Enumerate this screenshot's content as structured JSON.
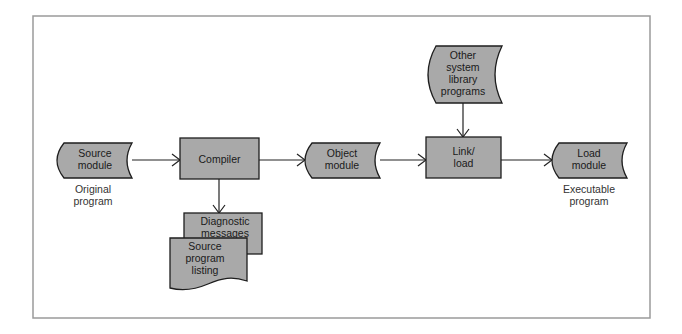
{
  "diagram": {
    "type": "flowchart",
    "title": "",
    "colors": {
      "node_fill": "#a9a9a9",
      "node_stroke": "#1e1e1e",
      "frame_stroke": "#9a9a9a",
      "edge": "#222222"
    },
    "nodes": {
      "source_module": {
        "shape": "stored-data",
        "lines": [
          "Source",
          "module"
        ],
        "caption": [
          "Original",
          "program"
        ]
      },
      "compiler": {
        "shape": "process",
        "lines": [
          "Compiler"
        ]
      },
      "diagnostic_messages": {
        "shape": "process",
        "lines": [
          "Diagnostic",
          "messages"
        ]
      },
      "source_program_listing": {
        "shape": "document",
        "lines": [
          "Source",
          "program",
          "listing"
        ]
      },
      "object_module": {
        "shape": "stored-data",
        "lines": [
          "Object",
          "module"
        ]
      },
      "other_system_library_programs": {
        "shape": "stored-data",
        "lines": [
          "Other",
          "system",
          "library",
          "programs"
        ]
      },
      "link_load": {
        "shape": "process",
        "lines": [
          "Link/",
          "load"
        ]
      },
      "load_module": {
        "shape": "stored-data",
        "lines": [
          "Load",
          "module"
        ],
        "caption": [
          "Executable",
          "program"
        ]
      }
    },
    "edges": [
      {
        "from": "Source module",
        "to": "Compiler"
      },
      {
        "from": "Compiler",
        "to": "Object module"
      },
      {
        "from": "Compiler",
        "to": "Diagnostic messages"
      },
      {
        "from": "Object module",
        "to": "Link/load"
      },
      {
        "from": "Other system library programs",
        "to": "Link/load"
      },
      {
        "from": "Link/load",
        "to": "Load module"
      }
    ]
  }
}
